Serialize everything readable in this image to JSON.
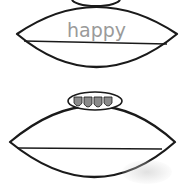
{
  "worksheet": {
    "footballs": [
      {
        "trace_word": "happy",
        "has_writing_line": true
      },
      {
        "trace_word": "",
        "has_writing_line": true,
        "laces_count": 4
      }
    ],
    "colors": {
      "outline": "#1a1a1a",
      "trace_text": "#9a9a9a",
      "laces_fill": "#8a8a8a"
    }
  }
}
